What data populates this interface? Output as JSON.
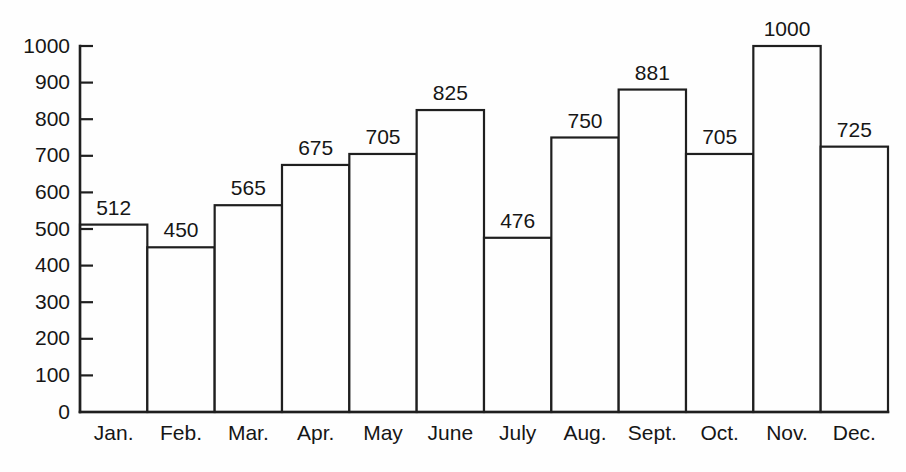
{
  "chart_data": {
    "type": "bar",
    "title": "",
    "subtitle": "",
    "xlabel": "",
    "ylabel": "",
    "categories": [
      "Jan.",
      "Feb.",
      "Mar.",
      "Apr.",
      "May",
      "June",
      "July",
      "Aug.",
      "Sept.",
      "Oct.",
      "Nov.",
      "Dec."
    ],
    "values": [
      512,
      450,
      565,
      675,
      705,
      825,
      476,
      750,
      881,
      705,
      1000,
      725
    ],
    "value_labels": [
      "512",
      "450",
      "565",
      "675",
      "705",
      "825",
      "476",
      "750",
      "881",
      "705",
      "1000",
      "725"
    ],
    "ylim": [
      0,
      1000
    ],
    "yticks": [
      0,
      100,
      200,
      300,
      400,
      500,
      600,
      700,
      800,
      900,
      1000
    ],
    "ytick_labels": [
      "0",
      "100",
      "200",
      "300",
      "400",
      "500",
      "600",
      "700",
      "800",
      "900",
      "1000"
    ],
    "grid": false,
    "legend": null,
    "legend_position": "none",
    "bar_fill_color": "#fefefe",
    "bar_edge_color": "#1f1f1f",
    "axis_color": "#1f1f1f",
    "text_color": "#161616",
    "background_color": "#fefefe",
    "annotations": "Each bar is labeled with its value above the bar top; bars are adjacent with no gaps."
  }
}
